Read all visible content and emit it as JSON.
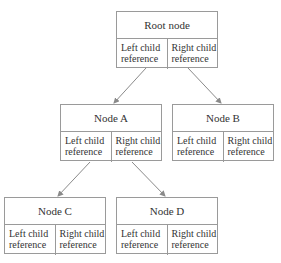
{
  "diagram": {
    "type": "binary-tree",
    "nodes": [
      {
        "id": "root",
        "label": "Root node",
        "left_ref": "Left child reference",
        "right_ref": "Right child reference"
      },
      {
        "id": "a",
        "label": "Node A",
        "left_ref": "Left child reference",
        "right_ref": "Right child reference"
      },
      {
        "id": "b",
        "label": "Node B",
        "left_ref": "Left child reference",
        "right_ref": "Right child reference"
      },
      {
        "id": "c",
        "label": "Node C",
        "left_ref": "Left child reference",
        "right_ref": "Right child reference"
      },
      {
        "id": "d",
        "label": "Node D",
        "left_ref": "Left child reference",
        "right_ref": "Right child reference"
      }
    ],
    "edges": [
      {
        "from": "root.left",
        "to": "a"
      },
      {
        "from": "root.right",
        "to": "b"
      },
      {
        "from": "a.left",
        "to": "c"
      },
      {
        "from": "a.right",
        "to": "d"
      }
    ],
    "colors": {
      "border": "#9a9a9a",
      "edge": "#8a8a8a",
      "text": "#333333"
    }
  }
}
